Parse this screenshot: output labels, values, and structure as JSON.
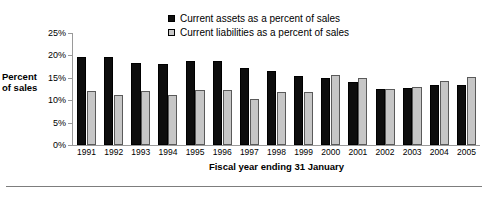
{
  "chart_data": {
    "type": "bar",
    "title": "",
    "xlabel": "Fiscal year ending 31 January",
    "ylabel": "Percent of sales",
    "ylim": [
      0,
      25
    ],
    "yticks": [
      0,
      5,
      10,
      15,
      20,
      25
    ],
    "ytick_labels": [
      "0%",
      "5%",
      "10%",
      "15%",
      "20%",
      "25%"
    ],
    "grid": false,
    "legend_position": "top-center",
    "categories": [
      "1991",
      "1992",
      "1993",
      "1994",
      "1995",
      "1996",
      "1997",
      "1998",
      "1999",
      "2000",
      "2001",
      "2002",
      "2003",
      "2004",
      "2005"
    ],
    "series": [
      {
        "name": "Current assets as a percent of sales",
        "color": "#0d0d0d",
        "values": [
          19.7,
          19.7,
          18.4,
          18.1,
          18.7,
          18.7,
          17.2,
          16.6,
          15.3,
          14.9,
          14.0,
          12.6,
          12.8,
          13.4,
          13.4
        ]
      },
      {
        "name": "Current liabilities as a percent of sales",
        "color": "#c6c6c6",
        "values": [
          12.0,
          11.2,
          12.0,
          11.1,
          12.2,
          12.2,
          10.2,
          11.8,
          11.9,
          15.7,
          14.9,
          12.4,
          13.0,
          14.4,
          15.2
        ]
      }
    ]
  },
  "legend": {
    "items": [
      {
        "label": "Current assets as a percent of sales",
        "swatch": "dark"
      },
      {
        "label": "Current liabilities as a percent of sales",
        "swatch": "light"
      }
    ]
  },
  "axis": {
    "y_title_line1": "Percent",
    "y_title_line2": "of sales",
    "x_title": "Fiscal year ending 31 January"
  },
  "footer": {
    "note": ""
  }
}
